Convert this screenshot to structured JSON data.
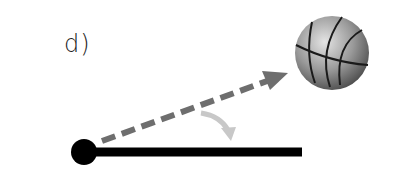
{
  "panel": {
    "label": "d)"
  },
  "diagram": {
    "elements": [
      {
        "name": "pivot-dot",
        "shape": "circle",
        "color": "#000000"
      },
      {
        "name": "lever-bar",
        "shape": "line",
        "color": "#000000"
      },
      {
        "name": "trajectory",
        "shape": "dashed-arrow",
        "color": "#6e6e6e"
      },
      {
        "name": "rotation-arrow",
        "shape": "curved-arrow",
        "color": "#c8c8c8"
      },
      {
        "name": "basketball",
        "shape": "ball",
        "color": "#8a8a8a"
      }
    ],
    "colors": {
      "bar": "#000000",
      "dashed_arrow": "#6e6e6e",
      "curved_arrow": "#c8c8c8",
      "ball_light": "#d8d8d8",
      "ball_dark": "#5a5a5a",
      "ball_seams": "#1a1a1a"
    }
  }
}
